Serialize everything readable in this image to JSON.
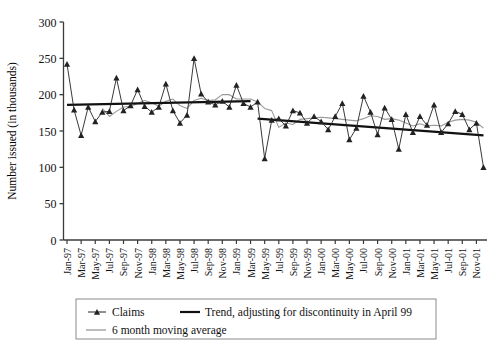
{
  "chart_data": {
    "type": "line",
    "title": "",
    "xlabel": "",
    "ylabel": "Number issued (in thousands)",
    "ylim": [
      0,
      300
    ],
    "yticks": [
      0,
      50,
      100,
      150,
      200,
      250,
      300
    ],
    "grid": false,
    "legend_position": "bottom",
    "x": [
      "Jan-97",
      "Feb-97",
      "Mar-97",
      "Apr-97",
      "May-97",
      "Jun-97",
      "Jul-97",
      "Aug-97",
      "Sep-97",
      "Oct-97",
      "Nov-97",
      "Dec-97",
      "Jan-98",
      "Feb-98",
      "Mar-98",
      "Apr-98",
      "May-98",
      "Jun-98",
      "Jul-98",
      "Aug-98",
      "Sep-98",
      "Oct-98",
      "Nov-98",
      "Dec-98",
      "Jan-99",
      "Feb-99",
      "Mar-99",
      "Apr-99",
      "May-99",
      "Jun-99",
      "Jul-99",
      "Aug-99",
      "Sep-99",
      "Oct-99",
      "Nov-99",
      "Dec-99",
      "Jan-00",
      "Feb-00",
      "Mar-00",
      "Apr-00",
      "May-00",
      "Jun-00",
      "Jul-00",
      "Aug-00",
      "Sep-00",
      "Oct-00",
      "Nov-00",
      "Dec-00",
      "Jan-01",
      "Feb-01",
      "Mar-01",
      "Apr-01",
      "May-01",
      "Jun-01",
      "Jul-01",
      "Aug-01",
      "Sep-01",
      "Oct-01",
      "Nov-01",
      "Dec-01"
    ],
    "xtick_labels": [
      "Jan-97",
      "Mar-97",
      "May-97",
      "Jul-97",
      "Sep-97",
      "Nov-97",
      "Jan-98",
      "Mar-98",
      "May-98",
      "Jul-98",
      "Sep-98",
      "Nov-98",
      "Jan-99",
      "Mar-99",
      "May-99",
      "Jul-99",
      "Sep-99",
      "Nov-99",
      "Jan-00",
      "Mar-00",
      "May-00",
      "Jul-00",
      "Sep-00",
      "Nov-00",
      "Jan-01",
      "Mar-01",
      "May-01",
      "Jul-01",
      "Sep-01",
      "Nov-01"
    ],
    "series": [
      {
        "name": "Claims",
        "style": "marker-line",
        "color": "#222222",
        "marker": "triangle",
        "values": [
          242,
          179,
          144,
          183,
          163,
          176,
          177,
          223,
          178,
          185,
          207,
          184,
          176,
          183,
          215,
          178,
          161,
          172,
          250,
          201,
          190,
          186,
          191,
          183,
          213,
          188,
          183,
          190,
          112,
          165,
          167,
          157,
          178,
          175,
          161,
          170,
          163,
          152,
          170,
          188,
          138,
          154,
          198,
          176,
          145,
          182,
          166,
          125,
          173,
          148,
          170,
          158,
          186,
          148,
          160,
          177,
          173,
          152,
          161,
          100
        ]
      },
      {
        "name": "Trend, adjusting for discontinuity in April 99",
        "style": "line",
        "color": "#111111",
        "segments": [
          {
            "from": "Jan-97",
            "to": "Mar-99",
            "y_from": 186,
            "y_to": 191
          },
          {
            "from": "Apr-99",
            "to": "Dec-01",
            "y_from": 167,
            "y_to": 144
          }
        ]
      },
      {
        "name": "6 month moving average",
        "style": "line",
        "color": "#9a9a9a",
        "values": [
          null,
          null,
          null,
          null,
          null,
          181,
          170,
          177,
          183,
          184,
          188,
          192,
          189,
          184,
          191,
          194,
          185,
          181,
          192,
          195,
          192,
          193,
          200,
          200,
          194,
          194,
          194,
          190,
          181,
          178,
          155,
          161,
          159,
          166,
          167,
          168,
          169,
          168,
          167,
          166,
          165,
          164,
          167,
          171,
          170,
          166,
          167,
          165,
          161,
          157,
          160,
          157,
          158,
          157,
          162,
          165,
          166,
          165,
          162,
          154
        ]
      }
    ],
    "annotations": []
  },
  "legend": {
    "items": [
      {
        "key": "claims",
        "label": "Claims",
        "marker": "triangle-line",
        "color": "#222222"
      },
      {
        "key": "trend",
        "label": "Trend, adjusting for discontinuity in April 99",
        "marker": "line-thick",
        "color": "#111111"
      },
      {
        "key": "moving-average",
        "label": "6 month moving average",
        "marker": "line-thin",
        "color": "#9a9a9a"
      }
    ]
  }
}
